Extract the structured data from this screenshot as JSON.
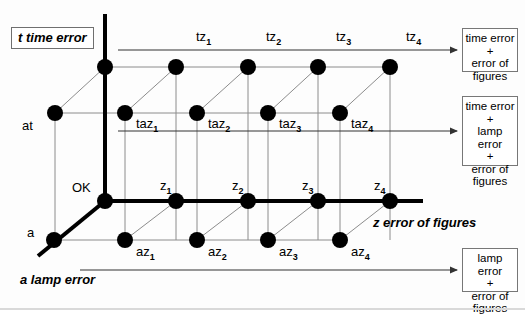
{
  "diagram": {
    "title_boxes": {
      "t_axis": "t time error",
      "a_axis": "a lamp error",
      "z_axis": "z error of figures"
    },
    "origin_label": "OK",
    "axis_origin_labels": {
      "t": "at",
      "a": "a"
    },
    "top_row_labels": [
      "tz",
      "tz",
      "tz",
      "tz"
    ],
    "top_row_subs": [
      "1",
      "2",
      "3",
      "4"
    ],
    "mid_row_labels": [
      "taz",
      "taz",
      "taz",
      "taz"
    ],
    "mid_row_subs": [
      "1",
      "2",
      "3",
      "4"
    ],
    "z_row_labels": [
      "z",
      "z",
      "z",
      "z"
    ],
    "z_row_subs": [
      "1",
      "2",
      "3",
      "4"
    ],
    "bottom_row_labels": [
      "az",
      "az",
      "az",
      "az"
    ],
    "bottom_row_subs": [
      "1",
      "2",
      "3",
      "4"
    ],
    "result_boxes": [
      {
        "lines": [
          "time error",
          "+",
          "error of figures"
        ]
      },
      {
        "lines": [
          "time error",
          "+",
          "lamp error",
          "+",
          "error of figures"
        ]
      },
      {
        "lines": [
          "lamp error",
          "+",
          "error of figures"
        ]
      }
    ],
    "colors": {
      "ink": "#000000",
      "grid": "#8c8c8c",
      "box_border": "#6f6f6f",
      "background": "#fdfdfd"
    },
    "geometry": {
      "t_row_y": 67,
      "at_row_y": 113,
      "z_row_y": 201,
      "a_row_y": 240,
      "front_x": [
        105,
        176,
        248,
        318,
        390
      ],
      "back_x": [
        55,
        125,
        197,
        268,
        340
      ]
    }
  }
}
